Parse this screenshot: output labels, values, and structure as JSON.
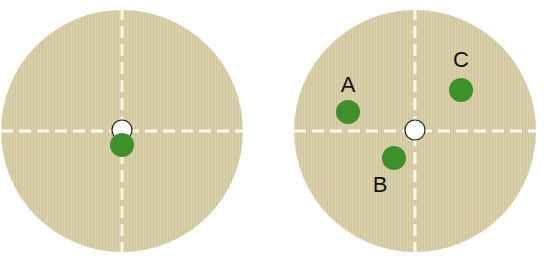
{
  "colors": {
    "plate": "#d8cfa8",
    "axis": "#fbf8ee",
    "organism": "#3f8f2a",
    "center": "#ffffff",
    "center_stroke": "#222222"
  },
  "diagrams": [
    {
      "id": "left",
      "description": "Circular plate with dashed crosshair; white center marker with single green dot directly below center",
      "dots": [
        {
          "label": ""
        }
      ]
    },
    {
      "id": "right",
      "description": "Circular plate with dashed crosshair; white center marker with three labeled green dots",
      "dots": [
        {
          "label": "A"
        },
        {
          "label": "B"
        },
        {
          "label": "C"
        }
      ]
    }
  ]
}
